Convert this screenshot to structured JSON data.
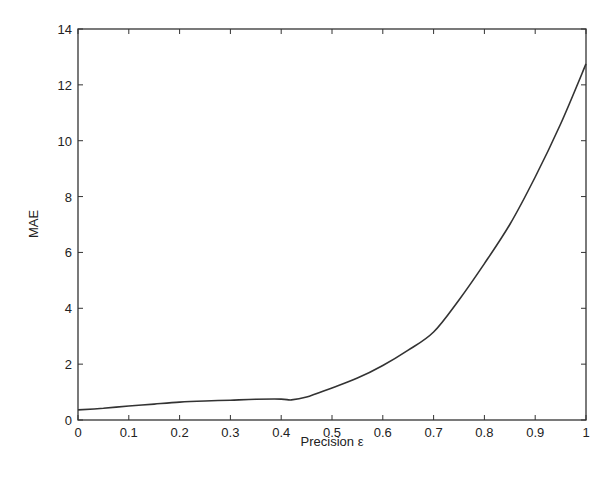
{
  "chart_data": {
    "type": "line",
    "title": "",
    "xlabel": "Precision ε",
    "ylabel": "MAE",
    "xlim": [
      0,
      1
    ],
    "ylim": [
      0,
      14
    ],
    "grid": false,
    "legend": null,
    "x_ticks": [
      "0",
      "0.1",
      "0.2",
      "0.3",
      "0.4",
      "0.5",
      "0.6",
      "0.7",
      "0.8",
      "0.9",
      "1"
    ],
    "y_ticks": [
      "0",
      "2",
      "4",
      "6",
      "8",
      "10",
      "12",
      "14"
    ],
    "series": [
      {
        "name": "MAE",
        "color": "#333333",
        "x": [
          0,
          0.05,
          0.1,
          0.15,
          0.2,
          0.25,
          0.3,
          0.35,
          0.4,
          0.42,
          0.45,
          0.5,
          0.55,
          0.6,
          0.65,
          0.7,
          0.75,
          0.8,
          0.85,
          0.9,
          0.95,
          1.0
        ],
        "values": [
          0.36,
          0.42,
          0.5,
          0.57,
          0.64,
          0.68,
          0.71,
          0.74,
          0.75,
          0.72,
          0.82,
          1.15,
          1.5,
          1.95,
          2.5,
          3.15,
          4.3,
          5.6,
          7.0,
          8.7,
          10.6,
          12.75
        ]
      }
    ]
  }
}
